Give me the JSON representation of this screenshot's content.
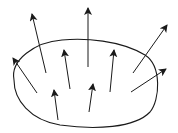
{
  "diagram": {
    "stroke_color": "#1a1a1a",
    "background": "#ffffff",
    "loop_path": "M 14 80 C 10 60, 35 42, 62 40 C 85 38, 120 40, 145 55 C 162 66, 160 100, 150 112 C 135 128, 95 130, 60 125 C 30 120, 14 100, 14 80 Z",
    "arrows": [
      {
        "id": "arrow-1",
        "x1": 37,
        "y1": 93,
        "x2": 13,
        "y2": 58
      },
      {
        "id": "arrow-2",
        "x1": 46,
        "y1": 73,
        "x2": 32,
        "y2": 14
      },
      {
        "id": "arrow-3",
        "x1": 70,
        "y1": 89,
        "x2": 64,
        "y2": 50
      },
      {
        "id": "arrow-4",
        "x1": 88,
        "y1": 67,
        "x2": 88,
        "y2": 8
      },
      {
        "id": "arrow-5",
        "x1": 58,
        "y1": 120,
        "x2": 54,
        "y2": 90
      },
      {
        "id": "arrow-6",
        "x1": 89,
        "y1": 112,
        "x2": 93,
        "y2": 84
      },
      {
        "id": "arrow-7",
        "x1": 110,
        "y1": 92,
        "x2": 114,
        "y2": 50
      },
      {
        "id": "arrow-8",
        "x1": 133,
        "y1": 73,
        "x2": 167,
        "y2": 25
      },
      {
        "id": "arrow-9",
        "x1": 131,
        "y1": 92,
        "x2": 166,
        "y2": 69
      }
    ]
  }
}
